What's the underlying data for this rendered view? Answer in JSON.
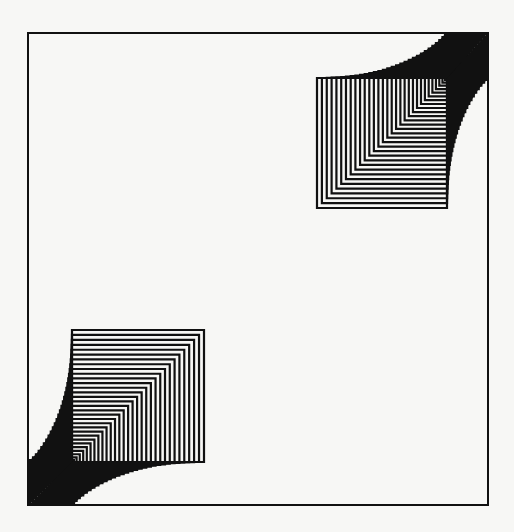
{
  "figure": {
    "width": 514,
    "height": 532,
    "background": "#f7f7f5",
    "ink": "#111111",
    "frame": {
      "x": 28,
      "y": 33,
      "width": 460,
      "height": 472
    },
    "groups": [
      {
        "name": "bottom-left-nested-squares",
        "origin": [
          30,
          504
        ],
        "inner_corner": [
          72,
          462
        ],
        "max_size": 130,
        "count": 30,
        "orientation": "bottom-left"
      },
      {
        "name": "top-right-nested-squares",
        "origin": [
          487,
          34
        ],
        "inner_corner": [
          447,
          78
        ],
        "max_size": 128,
        "count": 30,
        "orientation": "top-right"
      }
    ]
  }
}
